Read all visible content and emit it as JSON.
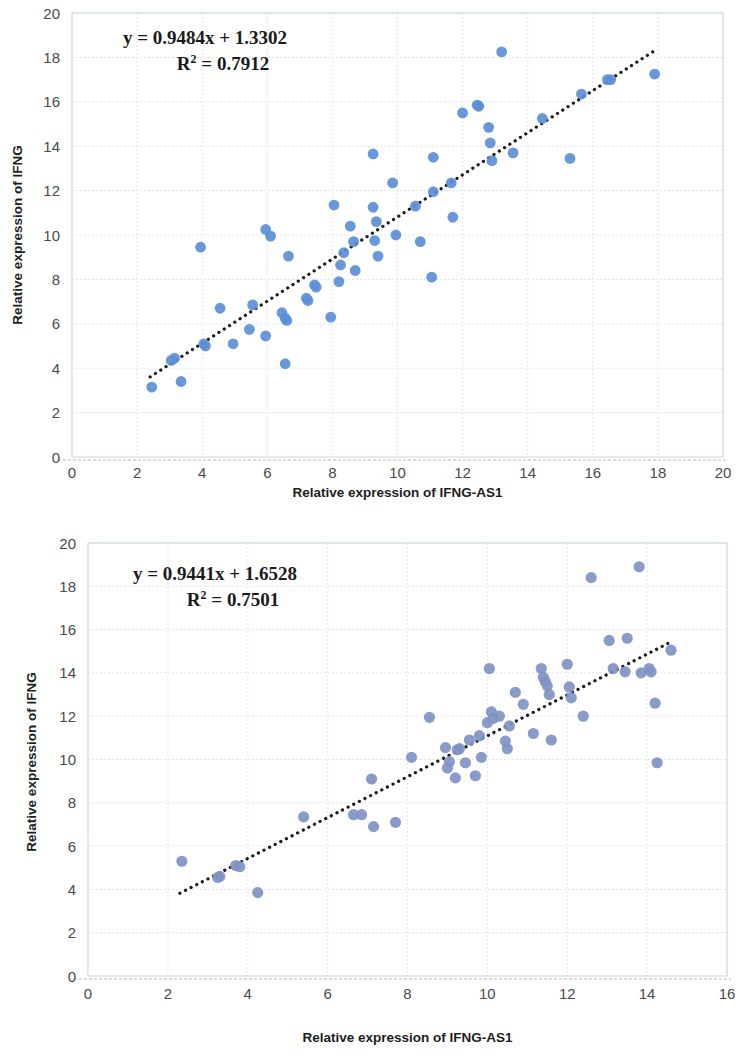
{
  "figures": [
    {
      "id": "top",
      "equation": "y = 0.9484x + 1.3302",
      "r2_prefix": "R",
      "r2_sup": "2",
      "r2_value": "= 0.7912",
      "xlabel": "Relative expression of IFNG-AS1",
      "ylabel": "Relative expression of IFNG",
      "xticks": [
        "0",
        "2",
        "4",
        "6",
        "8",
        "10",
        "12",
        "14",
        "16",
        "18",
        "20"
      ],
      "yticks": [
        "0",
        "2",
        "4",
        "6",
        "8",
        "10",
        "12",
        "14",
        "16",
        "18",
        "20"
      ]
    },
    {
      "id": "bottom",
      "equation": "y = 0.9441x + 1.6528",
      "r2_prefix": "R",
      "r2_sup": "2",
      "r2_value": "= 0.7501",
      "xlabel": "Relative expression of IFNG-AS1",
      "ylabel": "Relative expression of IFNG",
      "xticks": [
        "0",
        "2",
        "4",
        "6",
        "8",
        "10",
        "12",
        "14",
        "16"
      ],
      "yticks": [
        "0",
        "2",
        "4",
        "6",
        "8",
        "10",
        "12",
        "14",
        "16",
        "18",
        "20"
      ]
    }
  ],
  "chart_data": [
    {
      "type": "scatter",
      "title": "",
      "xlabel": "Relative expression of IFNG-AS1",
      "ylabel": "Relative expression of IFNG",
      "xlim": [
        0,
        20
      ],
      "ylim": [
        0,
        20
      ],
      "xticks": [
        0,
        2,
        4,
        6,
        8,
        10,
        12,
        14,
        16,
        18,
        20
      ],
      "yticks": [
        0,
        2,
        4,
        6,
        8,
        10,
        12,
        14,
        16,
        18,
        20
      ],
      "grid": true,
      "legend": "none",
      "annotations": [
        "y = 0.9484x + 1.3302",
        "R² = 0.7912"
      ],
      "marker_color": "#5b8fd4",
      "trendline": {
        "type": "linear",
        "slope": 0.9484,
        "intercept": 1.3302,
        "r_squared": 0.7912,
        "style": "dotted",
        "color": "#1b1b1b",
        "x_start": 2.4,
        "x_end": 18.0
      },
      "points": [
        [
          2.45,
          3.15
        ],
        [
          3.35,
          3.4
        ],
        [
          3.05,
          4.35
        ],
        [
          3.15,
          4.45
        ],
        [
          3.95,
          9.45
        ],
        [
          4.05,
          5.1
        ],
        [
          4.1,
          5.0
        ],
        [
          4.55,
          6.7
        ],
        [
          4.95,
          5.1
        ],
        [
          5.45,
          5.75
        ],
        [
          5.55,
          6.85
        ],
        [
          5.95,
          5.45
        ],
        [
          5.95,
          10.25
        ],
        [
          6.1,
          9.95
        ],
        [
          6.45,
          6.5
        ],
        [
          6.55,
          6.25
        ],
        [
          6.6,
          6.15
        ],
        [
          6.55,
          4.2
        ],
        [
          6.65,
          9.05
        ],
        [
          7.2,
          7.15
        ],
        [
          7.25,
          7.05
        ],
        [
          7.45,
          7.75
        ],
        [
          7.5,
          7.65
        ],
        [
          7.95,
          6.3
        ],
        [
          8.05,
          11.35
        ],
        [
          8.2,
          7.9
        ],
        [
          8.25,
          8.65
        ],
        [
          8.35,
          9.2
        ],
        [
          8.55,
          10.4
        ],
        [
          8.7,
          8.4
        ],
        [
          8.65,
          9.7
        ],
        [
          9.25,
          13.65
        ],
        [
          9.25,
          11.25
        ],
        [
          9.3,
          9.75
        ],
        [
          9.35,
          10.6
        ],
        [
          9.4,
          9.05
        ],
        [
          9.85,
          12.35
        ],
        [
          9.95,
          10.0
        ],
        [
          10.55,
          11.3
        ],
        [
          10.7,
          9.7
        ],
        [
          11.05,
          8.1
        ],
        [
          11.1,
          13.5
        ],
        [
          11.1,
          11.95
        ],
        [
          11.65,
          12.35
        ],
        [
          11.7,
          10.8
        ],
        [
          12.0,
          15.5
        ],
        [
          12.45,
          15.85
        ],
        [
          12.5,
          15.8
        ],
        [
          12.8,
          14.85
        ],
        [
          12.85,
          14.15
        ],
        [
          12.9,
          13.35
        ],
        [
          13.2,
          18.25
        ],
        [
          13.55,
          13.7
        ],
        [
          14.45,
          15.25
        ],
        [
          15.3,
          13.45
        ],
        [
          15.65,
          16.35
        ],
        [
          16.45,
          17.0
        ],
        [
          16.55,
          17.0
        ],
        [
          17.9,
          17.25
        ]
      ]
    },
    {
      "type": "scatter",
      "title": "",
      "xlabel": "Relative expression of IFNG-AS1",
      "ylabel": "Relative expression of IFNG",
      "xlim": [
        0,
        16
      ],
      "ylim": [
        0,
        20
      ],
      "xticks": [
        0,
        2,
        4,
        6,
        8,
        10,
        12,
        14,
        16
      ],
      "yticks": [
        0,
        2,
        4,
        6,
        8,
        10,
        12,
        14,
        16,
        18,
        20
      ],
      "grid": true,
      "legend": "none",
      "annotations": [
        "y = 0.9441x + 1.6528",
        "R² = 0.7501"
      ],
      "marker_color": "#8093c4",
      "trendline": {
        "type": "linear",
        "slope": 0.9441,
        "intercept": 1.6528,
        "r_squared": 0.7501,
        "style": "dotted",
        "color": "#1b1b1b",
        "x_start": 2.3,
        "x_end": 14.6
      },
      "points": [
        [
          2.35,
          5.3
        ],
        [
          3.25,
          4.55
        ],
        [
          3.3,
          4.6
        ],
        [
          3.7,
          5.1
        ],
        [
          3.8,
          5.05
        ],
        [
          4.25,
          3.85
        ],
        [
          5.4,
          7.35
        ],
        [
          6.65,
          7.45
        ],
        [
          6.85,
          7.45
        ],
        [
          7.1,
          9.1
        ],
        [
          7.15,
          6.9
        ],
        [
          7.7,
          7.1
        ],
        [
          8.1,
          10.1
        ],
        [
          8.55,
          11.95
        ],
        [
          8.95,
          10.55
        ],
        [
          9.0,
          9.6
        ],
        [
          9.05,
          9.9
        ],
        [
          9.2,
          9.15
        ],
        [
          9.25,
          10.45
        ],
        [
          9.3,
          10.5
        ],
        [
          9.45,
          9.85
        ],
        [
          9.55,
          10.9
        ],
        [
          9.7,
          9.25
        ],
        [
          9.8,
          11.1
        ],
        [
          9.85,
          10.1
        ],
        [
          10.0,
          11.7
        ],
        [
          10.05,
          14.2
        ],
        [
          10.1,
          12.2
        ],
        [
          10.15,
          11.9
        ],
        [
          10.3,
          12.0
        ],
        [
          10.45,
          10.85
        ],
        [
          10.5,
          10.5
        ],
        [
          10.55,
          11.55
        ],
        [
          10.7,
          13.1
        ],
        [
          10.9,
          12.55
        ],
        [
          11.15,
          11.2
        ],
        [
          11.35,
          14.2
        ],
        [
          11.4,
          13.8
        ],
        [
          11.45,
          13.6
        ],
        [
          11.5,
          13.4
        ],
        [
          11.55,
          13.0
        ],
        [
          11.6,
          10.9
        ],
        [
          12.0,
          14.4
        ],
        [
          12.05,
          13.35
        ],
        [
          12.1,
          12.85
        ],
        [
          12.4,
          12.0
        ],
        [
          12.6,
          18.4
        ],
        [
          13.05,
          15.5
        ],
        [
          13.15,
          14.2
        ],
        [
          13.45,
          14.05
        ],
        [
          13.5,
          15.6
        ],
        [
          13.8,
          18.9
        ],
        [
          13.85,
          14.0
        ],
        [
          14.05,
          14.2
        ],
        [
          14.1,
          14.05
        ],
        [
          14.2,
          12.6
        ],
        [
          14.25,
          9.85
        ],
        [
          14.6,
          15.05
        ]
      ]
    }
  ]
}
